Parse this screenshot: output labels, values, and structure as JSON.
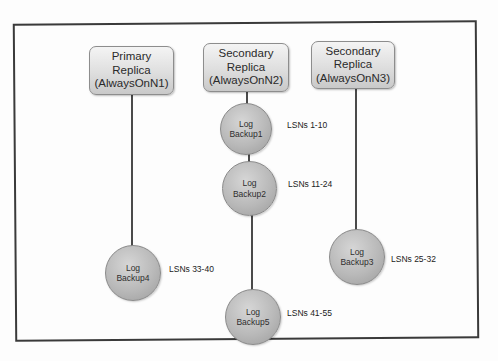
{
  "diagram": {
    "type": "always-on-log-backup-chain",
    "replicas": [
      {
        "id": "n1",
        "role": "Primary",
        "line1": "Primary",
        "line2": "Replica",
        "line3": "(AlwaysOnN1)"
      },
      {
        "id": "n2",
        "role": "Secondary",
        "line1": "Secondary",
        "line2": "Replica",
        "line3": "(AlwaysOnN2)"
      },
      {
        "id": "n3",
        "role": "Secondary",
        "line1": "Secondary",
        "line2": "Replica",
        "line3": "(AlwaysOnN3)"
      }
    ],
    "backups": [
      {
        "name_line1": "Log",
        "name_line2": "Backup1",
        "replica": "AlwaysOnN2",
        "lsn": "LSNs 1-10"
      },
      {
        "name_line1": "Log",
        "name_line2": "Backup2",
        "replica": "AlwaysOnN2",
        "lsn": "LSNs 11-24"
      },
      {
        "name_line1": "Log",
        "name_line2": "Backup3",
        "replica": "AlwaysOnN3",
        "lsn": "LSNs 25-32"
      },
      {
        "name_line1": "Log",
        "name_line2": "Backup4",
        "replica": "AlwaysOnN1",
        "lsn": "LSNs 33-40"
      },
      {
        "name_line1": "Log",
        "name_line2": "Backup5",
        "replica": "AlwaysOnN2",
        "lsn": "LSNs 41-55"
      }
    ],
    "colors": {
      "frame": "#3a3a3a",
      "connector": "#4a4a4a",
      "node_fill": "#b9b9b9",
      "replica_fill": "#dedede"
    }
  }
}
